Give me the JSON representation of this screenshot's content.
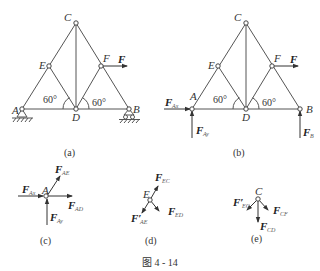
{
  "figure": {
    "caption": "图 4 - 14",
    "panels": {
      "a": {
        "label": "(a)",
        "nodes": {
          "A": "A",
          "B": "B",
          "C": "C",
          "D": "D",
          "E": "E",
          "F": "F"
        },
        "angles": [
          "60°",
          "60°"
        ],
        "load": {
          "symbol": "F",
          "sub": ""
        }
      },
      "b": {
        "label": "(b)",
        "nodes": {
          "A": "A",
          "B": "B",
          "C": "C",
          "D": "D",
          "E": "E",
          "F": "F"
        },
        "angles": [
          "60°",
          "60°"
        ],
        "load": {
          "symbol": "F",
          "sub": ""
        },
        "reactions": [
          {
            "symbol": "F",
            "sub": "Ax"
          },
          {
            "symbol": "F",
            "sub": "Ay"
          },
          {
            "symbol": "F",
            "sub": "B"
          }
        ]
      },
      "c": {
        "label": "(c)",
        "node": "A",
        "forces": [
          {
            "symbol": "F",
            "sub": "AE"
          },
          {
            "symbol": "F",
            "sub": "Ax"
          },
          {
            "symbol": "F",
            "sub": "AD"
          },
          {
            "symbol": "F",
            "sub": "Ay"
          }
        ]
      },
      "d": {
        "label": "(d)",
        "node": "E",
        "forces": [
          {
            "symbol": "F",
            "sub": "EC"
          },
          {
            "symbol": "F′",
            "sub": "AE"
          },
          {
            "symbol": "F",
            "sub": "ED"
          }
        ]
      },
      "e": {
        "label": "(e)",
        "node": "C",
        "forces": [
          {
            "symbol": "F′",
            "sub": "EC"
          },
          {
            "symbol": "F",
            "sub": "CF"
          },
          {
            "symbol": "F",
            "sub": "CD"
          }
        ]
      }
    }
  }
}
